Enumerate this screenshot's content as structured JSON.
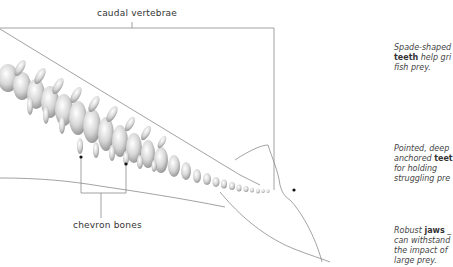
{
  "diagram": {
    "labels": {
      "caudal_vertebrae": "caudal vertebrae",
      "chevron_bones": "chevron bones"
    },
    "notes": [
      {
        "pre": "Spade-shaped",
        "bold": "teeth",
        "post": " help gri",
        "line3": "fish prey."
      },
      {
        "pre": "Pointed, deep",
        "line2a": "anchored ",
        "bold": "teet",
        "line3": "for holding",
        "line4": "struggling pre"
      },
      {
        "pre": "Robust ",
        "bold": "jaws",
        "post": " _",
        "line2": "can withstand",
        "line3": "the impact of",
        "line4": "large prey."
      }
    ],
    "colors": {
      "line": "#888888",
      "bone_light": "#f2f2f2",
      "bone_dark": "#9a9a9a",
      "dot": "#111111",
      "text": "#333333"
    }
  }
}
